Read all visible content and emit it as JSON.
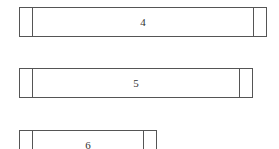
{
  "nodes": [
    {
      "key": "4"
    },
    {
      "key": "5"
    },
    {
      "key": "6"
    }
  ],
  "colors": {
    "border": "#555555",
    "text": "#333333",
    "background": "#ffffff"
  }
}
